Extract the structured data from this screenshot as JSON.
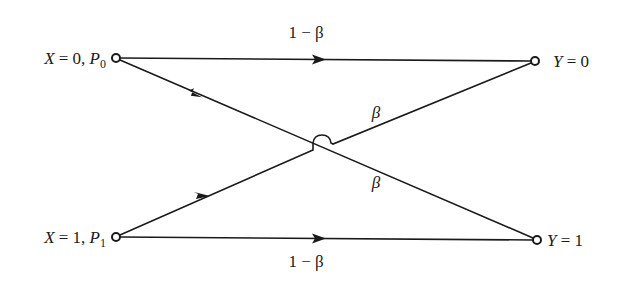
{
  "diagram": {
    "inputs": [
      {
        "symbol": "X",
        "eq": " = 0, ",
        "prob_symbol": "P",
        "prob_sub": "0"
      },
      {
        "symbol": "X",
        "eq": " = 1, ",
        "prob_symbol": "P",
        "prob_sub": "1"
      }
    ],
    "outputs": [
      {
        "symbol": "Y",
        "eq": " = 0"
      },
      {
        "symbol": "Y",
        "eq": " = 1"
      }
    ],
    "edges": [
      {
        "from": "X=0",
        "to": "Y=0",
        "label": "1 − β"
      },
      {
        "from": "X=0",
        "to": "Y=1",
        "label": "β"
      },
      {
        "from": "X=1",
        "to": "Y=0",
        "label": "β"
      },
      {
        "from": "X=1",
        "to": "Y=1",
        "label": "1 − β"
      }
    ],
    "colors": {
      "ink": "#1a1a1a",
      "background": "#ffffff"
    }
  }
}
